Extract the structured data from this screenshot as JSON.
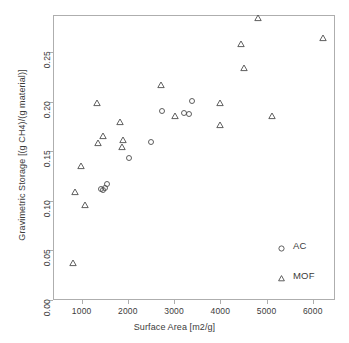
{
  "chart": {
    "type": "scatter",
    "title": "",
    "xlabel": "Surface Area [m2/g]",
    "ylabel": "Gravimetric Storage [(g CH4)/(g material)]",
    "xlim": [
      380,
      6480
    ],
    "ylim": [
      0.0,
      0.2875
    ],
    "grid": false,
    "xticks": [
      1000,
      2000,
      3000,
      4000,
      5000,
      6000
    ],
    "xticklabels": [
      "1000",
      "2000",
      "3000",
      "4000",
      "5000",
      "6000"
    ],
    "yticks": [
      0.0,
      0.05,
      0.1,
      0.15,
      0.2,
      0.25
    ],
    "yticklabels": [
      "0.00",
      "0.05",
      "0.10",
      "0.15",
      "0.20",
      "0.25"
    ],
    "legend": {
      "position": "bottom-right",
      "entries": [
        {
          "label": "AC",
          "marker": "circle"
        },
        {
          "label": "MOF",
          "marker": "triangle"
        }
      ]
    },
    "series": [
      {
        "name": "AC",
        "marker": "circle",
        "color": "#4d4d4d",
        "points": [
          [
            1400,
            0.113
          ],
          [
            1440,
            0.112
          ],
          [
            1480,
            0.114
          ],
          [
            1520,
            0.118
          ],
          [
            2000,
            0.144
          ],
          [
            2480,
            0.16
          ],
          [
            2720,
            0.192
          ],
          [
            3200,
            0.19
          ],
          [
            3300,
            0.189
          ],
          [
            3360,
            0.202
          ]
        ]
      },
      {
        "name": "MOF",
        "marker": "triangle",
        "color": "#4d4d4d",
        "points": [
          [
            800,
            0.038
          ],
          [
            840,
            0.11
          ],
          [
            1060,
            0.097
          ],
          [
            960,
            0.136
          ],
          [
            1340,
            0.159
          ],
          [
            1300,
            0.2
          ],
          [
            1440,
            0.166
          ],
          [
            1800,
            0.181
          ],
          [
            1860,
            0.155
          ],
          [
            1880,
            0.162
          ],
          [
            2700,
            0.218
          ],
          [
            3000,
            0.187
          ],
          [
            3960,
            0.178
          ],
          [
            3980,
            0.2
          ],
          [
            4420,
            0.259
          ],
          [
            4500,
            0.235
          ],
          [
            4800,
            0.285
          ],
          [
            5100,
            0.187
          ],
          [
            6200,
            0.265
          ]
        ]
      }
    ]
  }
}
